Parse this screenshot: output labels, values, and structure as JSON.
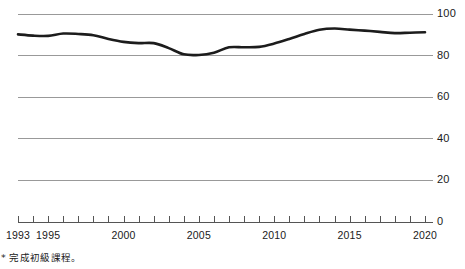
{
  "chart_data": {
    "type": "line",
    "title": "",
    "subtitle": "",
    "xlabel": "",
    "ylabel": "",
    "legend": [],
    "legend_position": "none",
    "grid": true,
    "xlim": [
      1993,
      2020
    ],
    "ylim": [
      0,
      100
    ],
    "yticks": [
      0,
      20,
      40,
      60,
      80,
      100
    ],
    "ytick_labels": [
      "0",
      "20",
      "40",
      "60",
      "80",
      "100"
    ],
    "xticks": [
      1993,
      1994,
      1995,
      1996,
      1997,
      1998,
      1999,
      2000,
      2001,
      2002,
      2003,
      2004,
      2005,
      2006,
      2007,
      2008,
      2009,
      2010,
      2011,
      2012,
      2013,
      2014,
      2015,
      2016,
      2017,
      2018,
      2019,
      2020
    ],
    "xtick_labels_shown": [
      "1993",
      "1995",
      "2000",
      "2005",
      "2010",
      "2015",
      "2020"
    ],
    "xtick_labels_shown_values": [
      1993,
      1995,
      2000,
      2005,
      2010,
      2015,
      2020
    ],
    "x": [
      1993,
      1994,
      1995,
      1996,
      1997,
      1998,
      1999,
      2000,
      2001,
      2002,
      2003,
      2004,
      2005,
      2006,
      2007,
      2008,
      2009,
      2010,
      2011,
      2012,
      2013,
      2014,
      2015,
      2016,
      2017,
      2018,
      2019,
      2020
    ],
    "series": [
      {
        "name": "completion-rate",
        "color": "#1c1c1c",
        "values": [
          90.2,
          89.6,
          89.5,
          90.6,
          90.4,
          89.8,
          88.0,
          86.6,
          86.0,
          86.0,
          83.6,
          80.6,
          80.3,
          81.4,
          84.0,
          84.0,
          84.2,
          85.8,
          88.0,
          90.4,
          92.4,
          93.0,
          92.5,
          92.0,
          91.4,
          90.8,
          91.0,
          91.2
        ]
      }
    ],
    "annotations": [],
    "footnote": "* 完成初級課程。"
  },
  "axes": {
    "y_labels": [
      {
        "value": 100,
        "text": "100"
      },
      {
        "value": 80,
        "text": "80"
      },
      {
        "value": 60,
        "text": "60"
      },
      {
        "value": 40,
        "text": "40"
      },
      {
        "value": 20,
        "text": "20"
      },
      {
        "value": 0,
        "text": "0"
      }
    ],
    "x_labels": [
      {
        "value": 1993,
        "text": "1993"
      },
      {
        "value": 1995,
        "text": "1995"
      },
      {
        "value": 2000,
        "text": "2000"
      },
      {
        "value": 2005,
        "text": "2005"
      },
      {
        "value": 2010,
        "text": "2010"
      },
      {
        "value": 2015,
        "text": "2015"
      },
      {
        "value": 2020,
        "text": "2020"
      }
    ]
  },
  "style": {
    "background": "#ffffff",
    "gridline_color": "#999999",
    "axis_color": "#555555",
    "line_color": "#1c1c1c",
    "text_color": "#1a1a1a"
  },
  "footnote": {
    "text": "* 完成初級課程。"
  }
}
